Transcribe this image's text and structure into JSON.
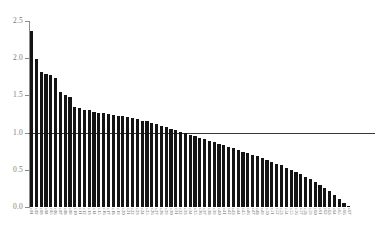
{
  "chart_data": {
    "type": "bar",
    "title": "",
    "subtitle": "",
    "xlabel": "",
    "ylabel": "",
    "ylim": [
      0.0,
      2.5
    ],
    "ytick_labels": [
      "0.0",
      "0.5",
      "1.0",
      "1.5",
      "2.0",
      "2.5"
    ],
    "ytick_values": [
      0.0,
      0.5,
      1.0,
      1.5,
      2.0,
      2.5
    ],
    "grid": false,
    "legend": null,
    "legend_position": "none",
    "bar_color": "#141414",
    "axis_color": "#8c8c8c",
    "tick_label_color": "#7a7a7a",
    "reference_lines": [
      {
        "orientation": "horizontal",
        "value": 1.0,
        "color": "#3a3a3a",
        "label": ""
      }
    ],
    "sorted": "descending",
    "n_bars": 67,
    "categories": [
      "c01",
      "c02",
      "c03",
      "c04",
      "c05",
      "c06",
      "c07",
      "c08",
      "c09",
      "c10",
      "c11",
      "c12",
      "c13",
      "c14",
      "c15",
      "c16",
      "c17",
      "c18",
      "c19",
      "c20",
      "c21",
      "c22",
      "c23",
      "c24",
      "c25",
      "c26",
      "c27",
      "c28",
      "c29",
      "c30",
      "c31",
      "c32",
      "c33",
      "c34",
      "c35",
      "c36",
      "c37",
      "c38",
      "c39",
      "c40",
      "c41",
      "c42",
      "c43",
      "c44",
      "c45",
      "c46",
      "c47",
      "c48",
      "c49",
      "c50",
      "c51",
      "c52",
      "c53",
      "c54",
      "c55",
      "c56",
      "c57",
      "c58",
      "c59",
      "c60",
      "c61",
      "c62",
      "c63",
      "c64",
      "c65",
      "c66",
      "c67"
    ],
    "category_labels_legible": false,
    "values": [
      2.37,
      1.99,
      1.81,
      1.79,
      1.78,
      1.73,
      1.54,
      1.5,
      1.48,
      1.35,
      1.33,
      1.31,
      1.3,
      1.28,
      1.27,
      1.26,
      1.25,
      1.24,
      1.23,
      1.22,
      1.21,
      1.2,
      1.18,
      1.16,
      1.15,
      1.13,
      1.11,
      1.09,
      1.07,
      1.05,
      1.03,
      1.01,
      0.99,
      0.97,
      0.95,
      0.93,
      0.91,
      0.89,
      0.87,
      0.85,
      0.83,
      0.81,
      0.79,
      0.77,
      0.74,
      0.72,
      0.7,
      0.68,
      0.66,
      0.63,
      0.61,
      0.58,
      0.56,
      0.53,
      0.5,
      0.47,
      0.44,
      0.41,
      0.38,
      0.34,
      0.3,
      0.26,
      0.21,
      0.16,
      0.11,
      0.06,
      0.02
    ]
  }
}
